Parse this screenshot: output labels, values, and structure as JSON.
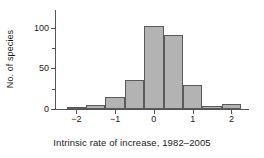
{
  "chart_data": {
    "type": "bar",
    "title": "",
    "subtitle": "",
    "xlabel": "Intrinsic rate of increase, 1982–2005",
    "ylabel": "No. of species",
    "grid": false,
    "legend": false,
    "bin_width": 0.5,
    "bin_edges": [
      -2.25,
      -1.75,
      -1.25,
      -0.75,
      -0.25,
      0.25,
      0.75,
      1.25,
      1.75,
      2.25
    ],
    "categories": [
      "-2.25 to -1.75",
      "-1.75 to -1.25",
      "-1.25 to -0.75",
      "-0.75 to -0.25",
      "-0.25 to 0.25",
      "0.25 to 0.75",
      "0.75 to 1.25",
      "1.25 to 1.75",
      "1.75 to 2.25"
    ],
    "bin_centers": [
      -2.0,
      -1.5,
      -1.0,
      -0.5,
      0.0,
      0.5,
      1.0,
      1.5,
      2.0
    ],
    "values": [
      3,
      5,
      15,
      36,
      102,
      91,
      30,
      4,
      6
    ],
    "xlim": [
      -2.55,
      2.35
    ],
    "ylim": [
      0,
      122
    ],
    "xticks": [
      -2,
      -1,
      0,
      1,
      2
    ],
    "xtick_labels": [
      "−2",
      "−1",
      "0",
      "1",
      "2"
    ],
    "yticks": [
      0,
      50,
      100
    ],
    "ytick_labels": [
      "0",
      "50",
      "100"
    ],
    "yticks_minor": [
      25,
      75
    ],
    "colors": {
      "bar_fill": "#b3b3b3",
      "bar_edge": "#5a5a5a",
      "axis": "#555555",
      "text": "#1a1a1a",
      "background": "#ffffff"
    }
  }
}
